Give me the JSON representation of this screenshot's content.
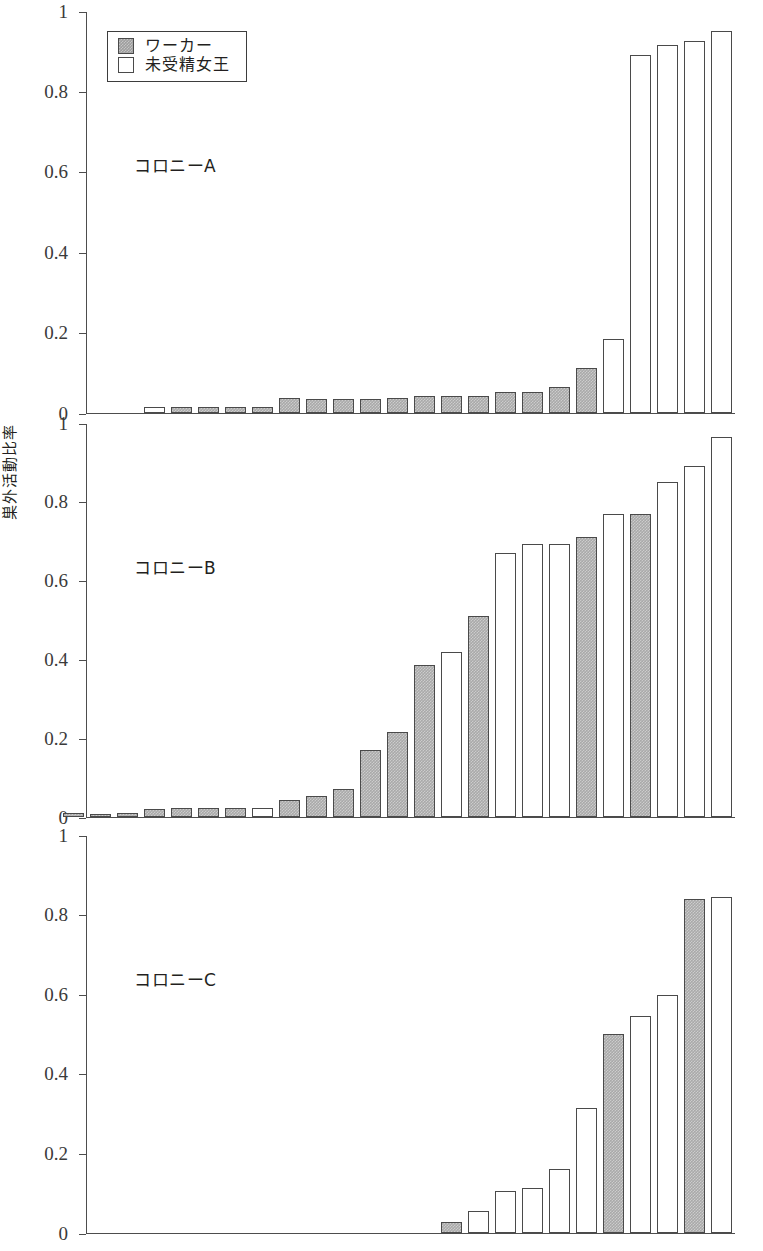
{
  "chart_data": {
    "type": "bar",
    "title": "",
    "ylabel": "巣外活動比率",
    "xlabel": "",
    "ylim": [
      0,
      1
    ],
    "ytick_labels": [
      "0",
      "0.2",
      "0.4",
      "0.6",
      "0.8",
      "1"
    ],
    "ytick_values": [
      0,
      0.2,
      0.4,
      0.6,
      0.8,
      1
    ],
    "grid": false,
    "legend_position": "top-left",
    "legend": [
      {
        "key": "worker",
        "label": "ワーカー",
        "fill": "#a9a9a9"
      },
      {
        "key": "queen",
        "label": "未受精女王",
        "fill": "#ffffff"
      }
    ],
    "panels": [
      {
        "id": "A",
        "label": "コロニーA",
        "categories": [
          "1",
          "2",
          "3",
          "4",
          "5",
          "6",
          "7",
          "8",
          "9",
          "10",
          "11",
          "12",
          "13",
          "14",
          "15",
          "16",
          "17",
          "18",
          "19",
          "20"
        ],
        "values": [
          0.012,
          0.012,
          0.012,
          0.012,
          0.013,
          0.035,
          0.033,
          0.033,
          0.033,
          0.034,
          0.04,
          0.04,
          0.04,
          0.05,
          0.05,
          0.062,
          0.11,
          0.182,
          0.89,
          0.915,
          0.925,
          0.95
        ],
        "types": [
          "queen",
          "worker",
          "worker",
          "worker",
          "worker",
          "worker",
          "worker",
          "worker",
          "worker",
          "worker",
          "worker",
          "worker",
          "worker",
          "worker",
          "worker",
          "worker",
          "worker",
          "queen",
          "queen",
          "queen",
          "queen",
          "queen"
        ]
      },
      {
        "id": "B",
        "label": "コロニーB",
        "categories": [
          "1",
          "2",
          "3",
          "4",
          "5",
          "6",
          "7",
          "8",
          "9",
          "10",
          "11",
          "12",
          "13",
          "14",
          "15",
          "16",
          "17",
          "18",
          "19",
          "20",
          "21",
          "22",
          "23",
          "24"
        ],
        "values": [
          0.007,
          0.005,
          0.007,
          0.018,
          0.021,
          0.021,
          0.021,
          0.021,
          0.041,
          0.052,
          0.07,
          0.168,
          0.215,
          0.383,
          0.418,
          0.51,
          0.668,
          0.692,
          0.692,
          0.71,
          0.768,
          0.768,
          0.85,
          0.89,
          0.965
        ],
        "types": [
          "worker",
          "worker",
          "worker",
          "worker",
          "worker",
          "worker",
          "worker",
          "queen",
          "worker",
          "worker",
          "worker",
          "worker",
          "worker",
          "worker",
          "queen",
          "worker",
          "queen",
          "queen",
          "queen",
          "worker",
          "queen",
          "worker",
          "queen",
          "queen",
          "queen"
        ]
      },
      {
        "id": "C",
        "label": "コロニーC",
        "categories": [
          "1",
          "2",
          "3",
          "4",
          "5",
          "6",
          "7",
          "8",
          "9"
        ],
        "values": [
          0.026,
          0.052,
          0.103,
          0.11,
          0.158,
          0.313,
          0.498,
          0.545,
          0.597,
          0.838,
          0.843
        ],
        "types": [
          "worker",
          "queen",
          "queen",
          "queen",
          "queen",
          "queen",
          "worker",
          "queen",
          "queen",
          "worker",
          "queen"
        ]
      }
    ]
  }
}
